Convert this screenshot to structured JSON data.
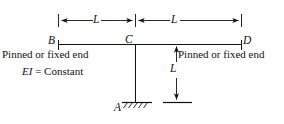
{
  "figure": {
    "kind": "structural-frame-diagram",
    "stroke_color": "#111111",
    "background_color": "#ffffff",
    "nodes": [
      {
        "id": "A",
        "label": "A",
        "role": "fixed-support-base"
      },
      {
        "id": "B",
        "label": "B",
        "role": "left-beam-end"
      },
      {
        "id": "C",
        "label": "C",
        "role": "beam-column-joint"
      },
      {
        "id": "D",
        "label": "D",
        "role": "right-beam-end"
      }
    ],
    "dimensions": [
      {
        "id": "span-left",
        "label": "L",
        "orientation": "horizontal"
      },
      {
        "id": "span-right",
        "label": "L",
        "orientation": "horizontal"
      },
      {
        "id": "column-height",
        "label": "L",
        "orientation": "vertical"
      }
    ],
    "annotations": {
      "left_end_condition": "Pinned or fixed end",
      "right_end_condition": "Pinned or fixed end",
      "stiffness_note_symbol": "EI",
      "stiffness_note_rest": " = Constant",
      "stiffness_note_full": "EI = Constant"
    },
    "support": {
      "type": "fixed",
      "hatch_marks": 5
    }
  }
}
